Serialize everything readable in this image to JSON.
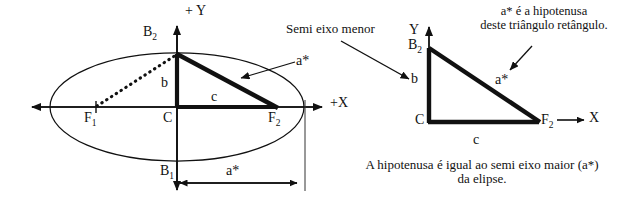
{
  "figure": {
    "title_note_right": {
      "line1": "a* é a hipotenusa",
      "line2": "deste triângulo retângulo."
    },
    "caption_bottom": {
      "line1": "A hipotenusa é igual ao semi eixo maior (a*)",
      "line2": "da elipse."
    },
    "callout_semi_minor": "Semi eixo menor"
  },
  "ellipse_diagram": {
    "axis_y_label": "+ Y",
    "axis_x_label": "+X",
    "point_top": "B",
    "point_top_sub": "2",
    "point_bottom": "B",
    "point_bottom_sub": "1",
    "focus_left": "F",
    "focus_left_sub": "1",
    "focus_right": "F",
    "focus_right_sub": "2",
    "center": "C",
    "seg_b": "b",
    "seg_c": "c",
    "seg_a": "a*",
    "measure_a": "a*"
  },
  "triangle_diagram": {
    "axis_y_label": "Y",
    "axis_x_label": "X",
    "vertex_top": "B",
    "vertex_top_sub": "2",
    "vertex_origin": "C",
    "vertex_right": "F",
    "vertex_right_sub": "2",
    "seg_b": "b",
    "seg_c": "c",
    "seg_a": "a*"
  },
  "colors": {
    "ink": "#111111",
    "thin_line": "#333333",
    "background": "#ffffff"
  }
}
